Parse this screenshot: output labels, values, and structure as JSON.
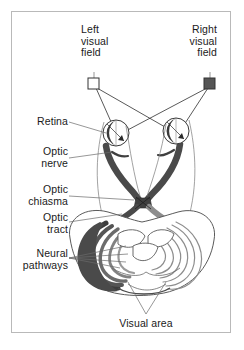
{
  "figure": {
    "background_color": "#ffffff",
    "border_color": "#b9b9b9"
  },
  "labels": {
    "left_visual_field": "Left\nvisual\nfield",
    "right_visual_field": "Right\nvisual\nfield",
    "retina": "Retina",
    "optic_nerve": "Optic\nnerve",
    "optic_chiasma": "Optic\nchiasma",
    "optic_tract": "Optic\ntract",
    "neural_pathways": "Neural\npathways",
    "visual_area": "Visual area"
  },
  "markers": {
    "left_field_marker": {
      "name": "open-square-marker",
      "fill": "#ffffff",
      "stroke": "#333333"
    },
    "right_field_marker": {
      "name": "filled-square-marker",
      "fill": "#555555",
      "stroke": "#333333"
    }
  },
  "colors": {
    "ink": "#1a1a1a",
    "line": "#3a3a3a",
    "leader": "#6a6a6a",
    "nerve_dark": "#4a4a4a",
    "nerve_mid": "#7d7d7d",
    "nerve_light": "#b5b5b5",
    "brain_outline": "#555555",
    "brain_fill": "#ffffff"
  },
  "structures": [
    {
      "name": "left-eye",
      "type": "eye"
    },
    {
      "name": "right-eye",
      "type": "eye"
    },
    {
      "name": "optic-nerve-left",
      "type": "nerve"
    },
    {
      "name": "optic-nerve-right",
      "type": "nerve"
    },
    {
      "name": "optic-chiasma",
      "type": "crossing"
    },
    {
      "name": "optic-tract-left",
      "type": "tract"
    },
    {
      "name": "optic-tract-right",
      "type": "tract"
    },
    {
      "name": "neural-pathways-left",
      "type": "radiation"
    },
    {
      "name": "neural-pathways-right",
      "type": "radiation"
    },
    {
      "name": "visual-cortex",
      "type": "cortex"
    }
  ]
}
